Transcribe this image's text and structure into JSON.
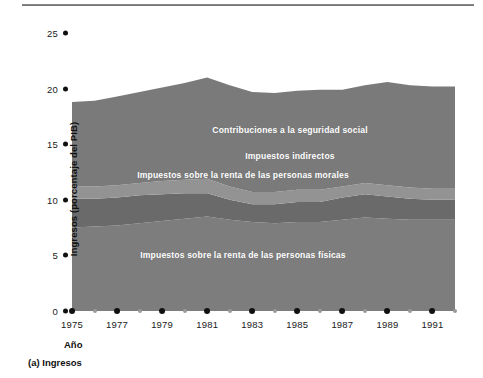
{
  "caption": "(a) Ingresos",
  "axes": {
    "ylabel": "Ingresos (porcentaje del PIB)",
    "xlabel": "Año",
    "yticks": [
      "0",
      "5",
      "10",
      "15",
      "20",
      "25"
    ],
    "xticks_major": [
      "1975",
      "1977",
      "1979",
      "1981",
      "1983",
      "1985",
      "1987",
      "1989",
      "1991"
    ]
  },
  "series_labels": {
    "social": "Contribuciones a la seguridad social",
    "indirect": "Impuestos indirectos",
    "corporate": "Impuestos sobre la renta de las personas morales",
    "personal": "Impuestos sobre la renta de las personas físicas"
  },
  "colors": {
    "personal": "#7d7d7d",
    "corporate": "#6a6a6a",
    "indirect": "#939393",
    "social": "#7a7a7a",
    "axis_text": "#1a1a1a",
    "label_text": "#ffffff"
  },
  "chart_data": {
    "type": "area",
    "title": "",
    "subtitle": "",
    "xlabel": "Año",
    "ylabel": "Ingresos (porcentaje del PIB)",
    "xlim": [
      1975,
      1992
    ],
    "ylim": [
      0,
      25
    ],
    "grid": false,
    "legend": "inline-labels",
    "stacked": true,
    "x": [
      1975,
      1976,
      1977,
      1978,
      1979,
      1980,
      1981,
      1982,
      1983,
      1984,
      1985,
      1986,
      1987,
      1988,
      1989,
      1990,
      1991,
      1992
    ],
    "series": [
      {
        "name": "Impuestos sobre la renta de las personas físicas",
        "values": [
          7.5,
          7.6,
          7.7,
          7.9,
          8.1,
          8.3,
          8.5,
          8.2,
          8.0,
          7.9,
          8.0,
          8.0,
          8.2,
          8.4,
          8.3,
          8.2,
          8.2,
          8.2
        ]
      },
      {
        "name": "Impuestos sobre la renta de las personas morales",
        "values": [
          2.6,
          2.5,
          2.5,
          2.5,
          2.4,
          2.3,
          2.1,
          1.8,
          1.6,
          1.7,
          1.8,
          1.8,
          2.0,
          2.1,
          2.0,
          1.9,
          1.8,
          1.8
        ]
      },
      {
        "name": "Impuestos indirectos",
        "values": [
          1.1,
          1.1,
          1.1,
          1.1,
          1.2,
          1.2,
          1.3,
          1.2,
          1.1,
          1.1,
          1.1,
          1.1,
          1.0,
          1.0,
          1.0,
          1.0,
          1.0,
          1.0
        ]
      },
      {
        "name": "Contribuciones a la seguridad social",
        "values": [
          7.6,
          7.7,
          8.0,
          8.2,
          8.4,
          8.7,
          9.1,
          9.1,
          9.0,
          8.9,
          8.9,
          9.0,
          8.7,
          8.8,
          9.3,
          9.2,
          9.2,
          9.2
        ]
      }
    ],
    "totals": [
      18.8,
      18.9,
      19.3,
      19.7,
      20.1,
      20.5,
      21.0,
      20.3,
      19.7,
      19.6,
      19.8,
      19.9,
      19.9,
      20.3,
      20.6,
      20.3,
      20.2,
      20.2
    ]
  }
}
